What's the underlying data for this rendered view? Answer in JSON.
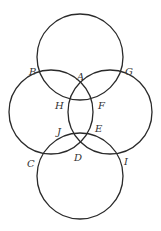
{
  "diagram": {
    "stroke_color": "#2a2a2a",
    "circles": [
      {
        "name": "top",
        "cx": 80,
        "cy": 57,
        "r": 43
      },
      {
        "name": "left",
        "cx": 51,
        "cy": 112,
        "r": 42
      },
      {
        "name": "right",
        "cx": 110,
        "cy": 112,
        "r": 42
      },
      {
        "name": "bottom",
        "cx": 80,
        "cy": 176,
        "r": 43
      }
    ],
    "points": [
      {
        "label": "A",
        "x": 77,
        "y": 72
      },
      {
        "label": "B",
        "x": 29,
        "y": 67
      },
      {
        "label": "G",
        "x": 125,
        "y": 67
      },
      {
        "label": "H",
        "x": 55,
        "y": 101
      },
      {
        "label": "F",
        "x": 98,
        "y": 101
      },
      {
        "label": "J",
        "x": 57,
        "y": 127
      },
      {
        "label": "E",
        "x": 95,
        "y": 124
      },
      {
        "label": "C",
        "x": 27,
        "y": 159
      },
      {
        "label": "D",
        "x": 74,
        "y": 153
      },
      {
        "label": "I",
        "x": 124,
        "y": 157
      }
    ]
  }
}
